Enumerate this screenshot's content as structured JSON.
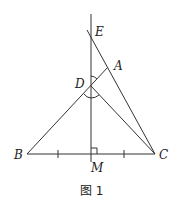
{
  "diagram": {
    "caption": "图 1",
    "labels": {
      "E": "E",
      "A": "A",
      "D": "D",
      "B": "B",
      "C": "C",
      "M": "M"
    },
    "points": {
      "E": [
        87,
        30
      ],
      "A": [
        107,
        68
      ],
      "D": [
        91,
        86
      ],
      "B": [
        27,
        154
      ],
      "C": [
        155,
        154
      ],
      "M": [
        91,
        154
      ]
    },
    "segments": [
      "BA",
      "BC",
      "DC",
      "EC",
      "vertical line through M and D (perpendicular bisector of BC)"
    ],
    "marks": {
      "right_angle_at": "M",
      "equal_ticks": [
        "BM",
        "MC"
      ],
      "angle_arcs_at": "D"
    },
    "stroke_color": "#333333"
  }
}
